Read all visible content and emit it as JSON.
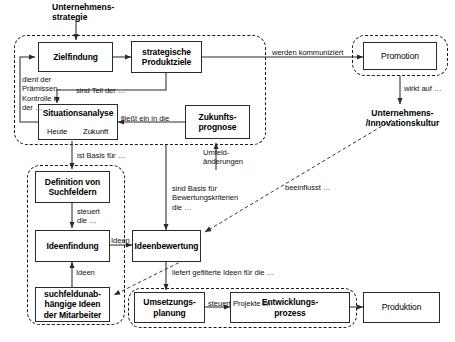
{
  "diagram": {
    "entry_label": "Unternehmens-\nstrategie",
    "free_labels": {
      "innovationskultur": "Unternehmens-\n/Innovationskultur"
    }
  },
  "boxes": {
    "zielfindung": "Zielfindung",
    "strategische_produktziele": "strategische\nProduktziele",
    "situationsanalyse": "Situationsanalyse",
    "situationsanalyse_heute": "Heute",
    "situationsanalyse_zukunft": "Zukunft",
    "zukunftsprognose": "Zukunfts-\nprognose",
    "promotion": "Promotion",
    "definition_von_suchfeldern": "Definition von\nSuchfeldern",
    "ideenfindung": "Ideenfindung",
    "suchfeldunabhaengige_ideen": "suchfeldunab-\nhängige Ideen\nder Mitarbeiter",
    "ideenbewertung": "Ideenbewertung",
    "umsetzungsplanung": "Umsetzungs-\nplanung",
    "entwicklungsprozess": "Entwicklungs-\nprozess",
    "produktion": "Produktion"
  },
  "edge_labels": {
    "dient_der": "dient der\nPrämissen-\nKontrolle in\nder …",
    "sind_teil_der": "sind Teil der …",
    "fliesst_ein_in_die": "fließt ein in die",
    "werden_kommuniziert": "werden kommuniziert",
    "wirkt_auf": "wirkt auf …",
    "umfeldaenderungen": "Umfeld-\nänderungen",
    "ist_basis_fuer": "ist Basis für …",
    "steuert_die": "steuert\ndie …",
    "ideen_1": "Ideen",
    "ideen_2": "Ideen",
    "sind_basis_fuer": "sind Basis für\nBewertungskriterien\ndie …",
    "beeinflusst": "beeinflusst …",
    "liefert_gefilterte_ideen": "liefert gefilterte Ideen für die …",
    "steuert_projekte_im": "steuert Projekte im"
  },
  "colors": {
    "line": "#2b2b2b",
    "dashed_group": "#1a1a1a",
    "text": "#000000",
    "background": "#ffffff"
  }
}
